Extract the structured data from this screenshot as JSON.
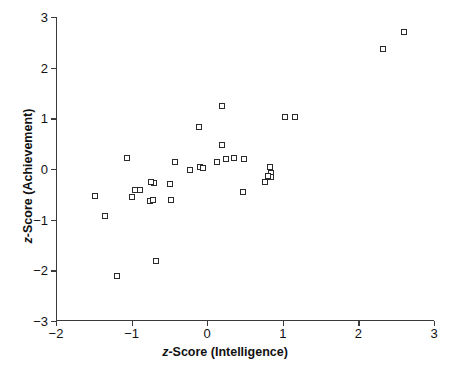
{
  "chart_data": {
    "type": "scatter",
    "title": "",
    "xlabel": "z-Score (Intelligence)",
    "ylabel": "z-Score (Achievement)",
    "xlabel_prefix": "z",
    "xlabel_rest": "-Score (Intelligence)",
    "ylabel_prefix": "z",
    "ylabel_rest": "-Score (Achievement)",
    "xlim": [
      -2,
      3
    ],
    "ylim": [
      -3,
      3
    ],
    "xticks": [
      -2,
      -1,
      0,
      1,
      2,
      3
    ],
    "yticks": [
      3,
      2,
      1,
      0,
      -1,
      -2,
      -3
    ],
    "xticklabels": [
      "−2",
      "−1",
      "0",
      "1",
      "2",
      "3"
    ],
    "yticklabels": [
      "3",
      "2",
      "1",
      "0",
      "−1",
      "−2",
      "−3"
    ],
    "grid": false,
    "legend": null,
    "marker": "open-square",
    "marker_color": "#2b2b2b",
    "marker_fill": "#ffffff",
    "axis_color": "#3a3a3a",
    "background": "#ffffff",
    "n_points": 35,
    "points": [
      {
        "x": -1.48,
        "y": -0.54
      },
      {
        "x": -1.35,
        "y": -0.93
      },
      {
        "x": -1.19,
        "y": -2.12
      },
      {
        "x": -1.06,
        "y": 0.22
      },
      {
        "x": -1.0,
        "y": -0.55
      },
      {
        "x": -0.95,
        "y": -0.41
      },
      {
        "x": -0.89,
        "y": -0.41
      },
      {
        "x": -0.76,
        "y": -0.63
      },
      {
        "x": -0.7,
        "y": -0.28
      },
      {
        "x": -0.68,
        "y": -1.82
      },
      {
        "x": -0.72,
        "y": -0.62
      },
      {
        "x": -0.49,
        "y": -0.29
      },
      {
        "x": -0.48,
        "y": -0.62
      },
      {
        "x": -0.43,
        "y": 0.13
      },
      {
        "x": -0.23,
        "y": -0.02
      },
      {
        "x": -0.11,
        "y": 0.82
      },
      {
        "x": -0.1,
        "y": 0.04
      },
      {
        "x": 0.13,
        "y": 0.13
      },
      {
        "x": 0.2,
        "y": 1.25
      },
      {
        "x": 0.2,
        "y": 0.48
      },
      {
        "x": 0.25,
        "y": 0.2
      },
      {
        "x": 0.35,
        "y": 0.21
      },
      {
        "x": 0.47,
        "y": -0.45
      },
      {
        "x": 0.76,
        "y": -0.25
      },
      {
        "x": 0.83,
        "y": 0.03
      },
      {
        "x": 0.85,
        "y": -0.08
      },
      {
        "x": 0.85,
        "y": -0.16
      },
      {
        "x": 1.03,
        "y": 1.03
      },
      {
        "x": 1.16,
        "y": 1.03
      },
      {
        "x": 2.33,
        "y": 2.37
      },
      {
        "x": 2.6,
        "y": 2.7
      },
      {
        "x": -0.75,
        "y": -0.26
      },
      {
        "x": -0.05,
        "y": 0.02
      },
      {
        "x": 0.49,
        "y": 0.2
      },
      {
        "x": 0.8,
        "y": -0.14
      }
    ]
  }
}
